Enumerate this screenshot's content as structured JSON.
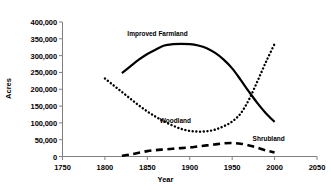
{
  "chart_data": {
    "type": "line",
    "title": "",
    "xlabel": "Year",
    "ylabel": "Acres",
    "xlim": [
      1750,
      2050
    ],
    "ylim": [
      0,
      400000
    ],
    "grid": false,
    "legend_position": "inline-annotations",
    "xticks": [
      "1750",
      "1800",
      "1850",
      "1900",
      "1950",
      "2000",
      "2050"
    ],
    "xtick_values": [
      1750,
      1800,
      1850,
      1900,
      1950,
      2000,
      2050
    ],
    "yticks": [
      "0",
      "50,000",
      "100,000",
      "150,000",
      "200,000",
      "250,000",
      "300,000",
      "350,000",
      "400,000"
    ],
    "ytick_values": [
      0,
      50000,
      100000,
      150000,
      200000,
      250000,
      300000,
      350000,
      400000
    ],
    "series": [
      {
        "name": "Improved Farmland",
        "style": "solid",
        "color": "#000000",
        "x": [
          1820,
          1830,
          1840,
          1850,
          1860,
          1870,
          1880,
          1890,
          1900,
          1910,
          1920,
          1930,
          1940,
          1950,
          1960,
          1970,
          1980,
          1990,
          2000
        ],
        "values": [
          248000,
          268000,
          288000,
          305000,
          318000,
          330000,
          334000,
          335000,
          334000,
          330000,
          322000,
          308000,
          288000,
          262000,
          228000,
          192000,
          158000,
          128000,
          103000
        ]
      },
      {
        "name": "Woodland",
        "style": "dotted",
        "color": "#000000",
        "x": [
          1800,
          1810,
          1820,
          1830,
          1840,
          1850,
          1860,
          1870,
          1880,
          1890,
          1900,
          1910,
          1920,
          1930,
          1940,
          1950,
          1960,
          1970,
          1980,
          1990,
          2000
        ],
        "values": [
          232000,
          212000,
          192000,
          172000,
          152000,
          134000,
          118000,
          104000,
          92000,
          82000,
          76000,
          74000,
          75000,
          80000,
          90000,
          104000,
          128000,
          170000,
          225000,
          282000,
          335000
        ]
      },
      {
        "name": "Shrubland",
        "style": "dashed",
        "color": "#000000",
        "x": [
          1820,
          1830,
          1840,
          1850,
          1860,
          1870,
          1880,
          1890,
          1900,
          1910,
          1920,
          1930,
          1940,
          1950,
          1960,
          1970,
          1980,
          1990,
          2000
        ],
        "values": [
          2000,
          6000,
          11000,
          16000,
          19000,
          21000,
          23000,
          25000,
          27000,
          30000,
          33000,
          36000,
          39000,
          40000,
          38000,
          33000,
          26000,
          18000,
          12000
        ]
      }
    ],
    "annotations": [
      {
        "text": "Improved Farmland",
        "x": 1862,
        "y": 368000
      },
      {
        "text": "Woodland",
        "x": 1883,
        "y": 110000
      },
      {
        "text": "Shrubland",
        "x": 1993,
        "y": 56000
      }
    ]
  }
}
